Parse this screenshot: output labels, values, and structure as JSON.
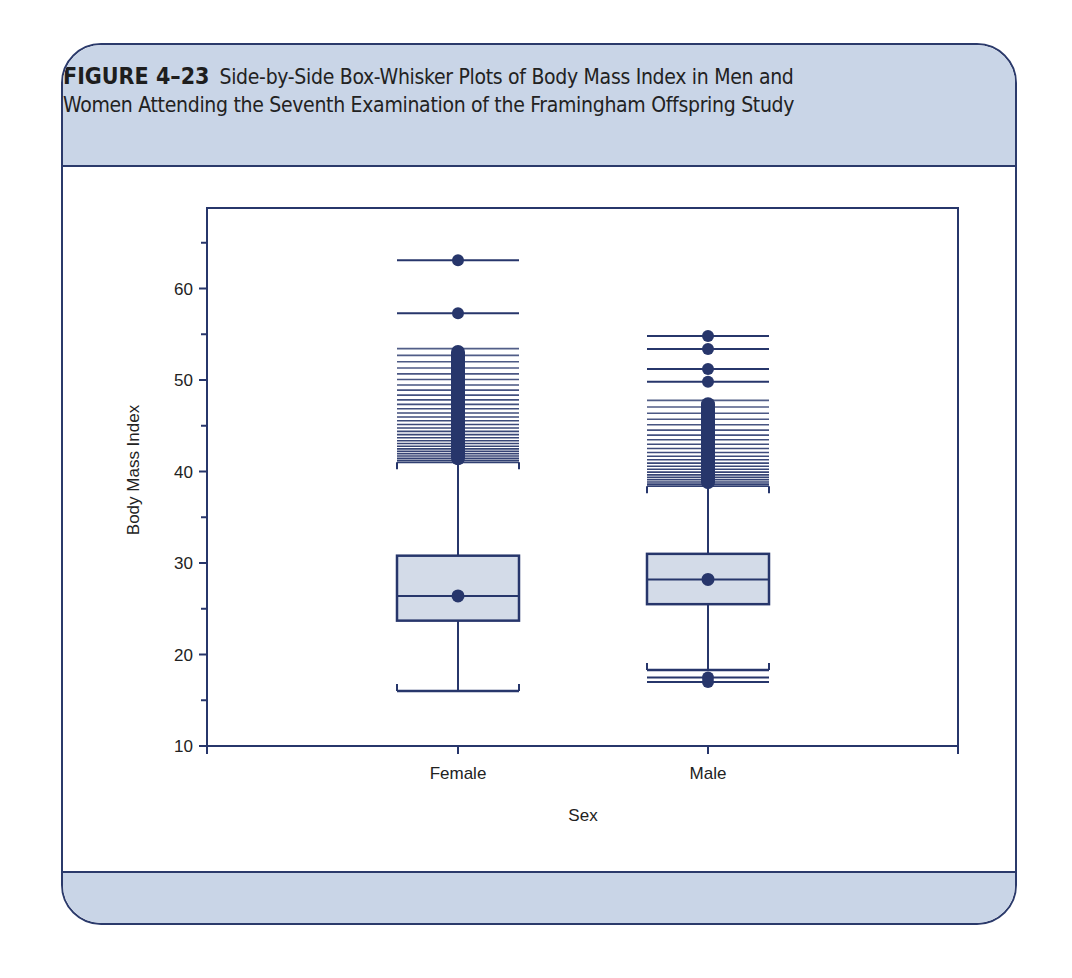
{
  "figure": {
    "label": "FIGURE 4–23",
    "caption_line1": "Side-by-Side Box-Whisker Plots of Body Mass Index in Men and",
    "caption_line2": "Women Attending the Seventh Examination of the Framingham Offspring Study"
  },
  "colors": {
    "border": "#2b3a6b",
    "header_bg": "#c9d5e7",
    "box_fill": "#d3dbe8",
    "ink": "#27366b"
  },
  "chart_data": {
    "type": "box",
    "title": "Side-by-Side Box-Whisker Plots of Body Mass Index in Men and Women Attending the Seventh Examination of the Framingham Offspring Study",
    "xlabel": "Sex",
    "ylabel": "Body Mass Index",
    "ylim": [
      10,
      68
    ],
    "yticks": [
      10,
      20,
      30,
      40,
      50,
      60
    ],
    "yminor_ticks": [
      15,
      25,
      35,
      45,
      55,
      65
    ],
    "grid": false,
    "categories": [
      "Female",
      "Male"
    ],
    "series": [
      {
        "name": "Female",
        "whisker_low": 16.0,
        "q1": 23.7,
        "median": 26.4,
        "mean": 26.4,
        "q3": 30.8,
        "whisker_high": 41.0,
        "outlier_band": [
          41.0,
          53.5
        ],
        "outliers": [
          63.1,
          57.3
        ]
      },
      {
        "name": "Male",
        "whisker_low": 18.3,
        "q1": 25.5,
        "median": 28.2,
        "mean": 28.2,
        "q3": 31.0,
        "whisker_high": 38.4,
        "outlier_band": [
          38.4,
          47.8
        ],
        "outliers": [
          54.8,
          53.4,
          51.2,
          49.8,
          17.5,
          17.0
        ]
      }
    ]
  }
}
